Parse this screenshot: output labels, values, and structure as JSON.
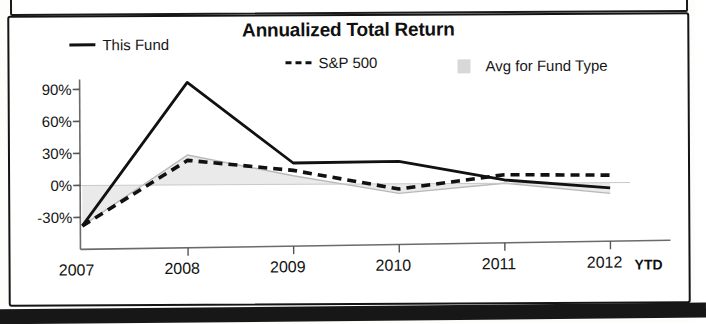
{
  "document": {
    "page_background": "#ffffff",
    "bottom_band_color": "#171717"
  },
  "chart_panel": {
    "title": "Annualized Total Return",
    "ytd_note": "YTD"
  },
  "legend": {
    "position": "top",
    "entries": [
      {
        "label": "This Fund",
        "marker": "solid-line-swatch",
        "color": "#111111"
      },
      {
        "label": "S&P 500",
        "marker": "dashed-line-swatch",
        "color": "#111111"
      },
      {
        "label": "Avg for Fund Type",
        "marker": "area-swatch",
        "color": "#d8d8d8"
      }
    ]
  },
  "chart_data": {
    "type": "line",
    "title": "Annualized Total Return",
    "xlabel": "",
    "ylabel": "",
    "x": [
      "2007",
      "2008",
      "2009",
      "2010",
      "2011",
      "2012"
    ],
    "categories": [
      "2007",
      "2008",
      "2009",
      "2010",
      "2011",
      "2012"
    ],
    "ylim": [
      -40,
      100
    ],
    "ytick_values": [
      90,
      60,
      30,
      0,
      -30
    ],
    "ytick_labels": [
      "90%",
      "60%",
      "30%",
      "0%",
      "-30%"
    ],
    "grid": false,
    "zero_line": true,
    "legend_position": "top",
    "series": [
      {
        "name": "This Fund",
        "style": "solid",
        "color": "#111111",
        "values": [
          -38,
          96,
          20,
          21,
          3,
          -5
        ]
      },
      {
        "name": "S&P 500",
        "style": "dashed",
        "color": "#111111",
        "values": [
          -38,
          23,
          13,
          -5,
          8,
          7
        ]
      },
      {
        "name": "Avg for Fund Type",
        "style": "area",
        "color": "#d8d8d8",
        "values": [
          -38,
          28,
          8,
          -9,
          0,
          -10
        ]
      }
    ]
  }
}
